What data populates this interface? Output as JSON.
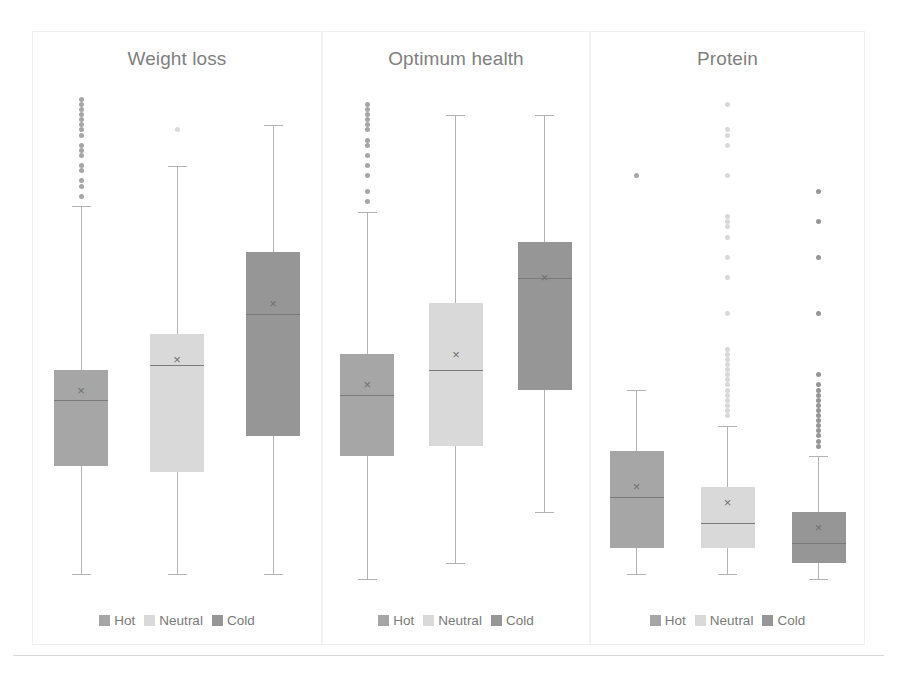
{
  "figure": {
    "background": "#ffffff",
    "divider_color": "#d9d9d9"
  },
  "legend": {
    "entries": [
      {
        "label": "Hot",
        "color": "#a6a6a6"
      },
      {
        "label": "Neutral",
        "color": "#d9d9d9"
      },
      {
        "label": "Cold",
        "color": "#969696"
      }
    ]
  },
  "series_colors": {
    "hot": "#a6a6a6",
    "neutral": "#d9d9d9",
    "cold": "#969696",
    "whisker": "#b3b3b3",
    "median": "#7a7a7a",
    "mean_marker": "#707070"
  },
  "panels": [
    {
      "key": "weight_loss",
      "title": "Weight loss"
    },
    {
      "key": "optimum_health",
      "title": "Optimum health"
    },
    {
      "key": "protein",
      "title": "Protein"
    }
  ],
  "chart_data": {
    "type": "box",
    "title": "",
    "xlabel": "",
    "ylabel": "",
    "grid": false,
    "legend_position": "bottom",
    "categories": [
      "Hot",
      "Neutral",
      "Cold"
    ],
    "axis_note": "y-axis unlabelled; values below are normalised 0-100 positions read off the plotted pixels (100 = top of plot area)",
    "panels": [
      {
        "name": "Weight loss",
        "boxes": [
          {
            "group": "Hot",
            "color": "#a6a6a6",
            "whisker_low": 4,
            "q1": 25,
            "median": 38,
            "mean": 40,
            "q3": 44,
            "whisker_high": 76,
            "outliers": [
              78,
              80,
              81,
              83,
              84,
              86,
              87,
              88,
              90,
              91,
              92,
              93,
              94,
              95,
              96,
              97
            ]
          },
          {
            "group": "Neutral",
            "color": "#d9d9d9",
            "whisker_low": 4,
            "q1": 24,
            "median": 45,
            "mean": 46,
            "q3": 51,
            "whisker_high": 84,
            "outliers": [
              91
            ]
          },
          {
            "group": "Cold",
            "color": "#969696",
            "whisker_low": 4,
            "q1": 31,
            "median": 55,
            "mean": 57,
            "q3": 67,
            "whisker_high": 92,
            "outliers": []
          }
        ]
      },
      {
        "name": "Optimum health",
        "boxes": [
          {
            "group": "Hot",
            "color": "#a6a6a6",
            "whisker_low": 3,
            "q1": 27,
            "median": 39,
            "mean": 41,
            "q3": 47,
            "whisker_high": 75,
            "outliers": [
              77,
              79,
              82,
              84,
              86,
              88,
              89,
              91,
              92,
              93,
              94,
              95,
              96
            ]
          },
          {
            "group": "Neutral",
            "color": "#d9d9d9",
            "whisker_low": 6,
            "q1": 29,
            "median": 44,
            "mean": 47,
            "q3": 57,
            "whisker_high": 94,
            "outliers": []
          },
          {
            "group": "Cold",
            "color": "#969696",
            "whisker_low": 16,
            "q1": 40,
            "median": 62,
            "mean": 62,
            "q3": 69,
            "whisker_high": 94,
            "outliers": []
          }
        ]
      },
      {
        "name": "Protein",
        "boxes": [
          {
            "group": "Hot",
            "color": "#a6a6a6",
            "whisker_low": 4,
            "q1": 9,
            "median": 19,
            "mean": 21,
            "q3": 28,
            "whisker_high": 40,
            "outliers": [
              82
            ]
          },
          {
            "group": "Neutral",
            "color": "#d9d9d9",
            "whisker_low": 4,
            "q1": 9,
            "median": 14,
            "mean": 18,
            "q3": 21,
            "whisker_high": 33,
            "outliers": [
              35,
              36,
              37,
              38,
              39,
              40,
              41,
              42,
              43,
              44,
              45,
              46,
              47,
              48,
              55,
              62,
              66,
              70,
              72,
              73,
              74,
              82,
              88,
              90,
              91,
              96
            ]
          },
          {
            "group": "Cold",
            "color": "#969696",
            "whisker_low": 3,
            "q1": 6,
            "median": 10,
            "mean": 13,
            "q3": 16,
            "whisker_high": 27,
            "outliers": [
              29,
              30,
              31,
              32,
              33,
              34,
              35,
              36,
              37,
              38,
              39,
              40,
              41,
              43,
              55,
              66,
              73,
              79
            ]
          }
        ]
      }
    ]
  }
}
